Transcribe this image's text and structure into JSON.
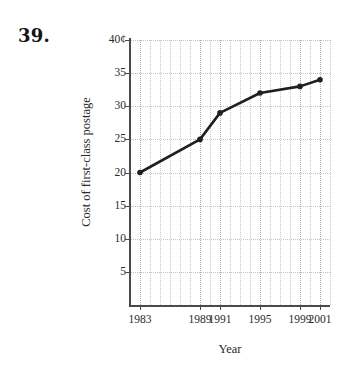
{
  "problem": {
    "number": "39."
  },
  "chart_data": {
    "type": "line",
    "title": "",
    "xlabel": "Year",
    "ylabel": "Cost of first-class postage",
    "x": [
      1983,
      1989,
      1991,
      1995,
      1999,
      2001
    ],
    "values": [
      20,
      25,
      29,
      32,
      33,
      34
    ],
    "categories": [
      "1983",
      "1989",
      "1991",
      "1995",
      "1999",
      "2001"
    ],
    "xtick_labels": [
      "1983",
      "1989",
      "1991",
      "1995",
      "1999",
      "2001"
    ],
    "ytick_labels": [
      "5",
      "10",
      "15",
      "20",
      "25",
      "30",
      "35",
      "40¢"
    ],
    "ytick_values": [
      5,
      10,
      15,
      20,
      25,
      30,
      35,
      40
    ],
    "xlim": [
      1982,
      2002
    ],
    "ylim": [
      0,
      40
    ],
    "grid": true,
    "legend": "none",
    "series_color": "#1f1f1f",
    "grid_color": "#c9c9c9",
    "axis_color": "#4a4a4a",
    "marker": "circle",
    "units": "cents"
  }
}
